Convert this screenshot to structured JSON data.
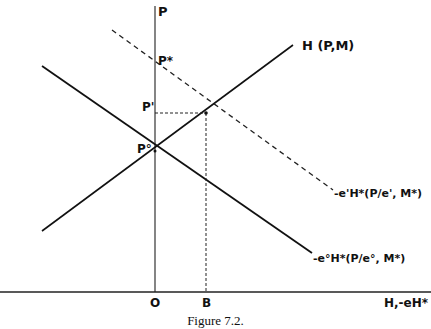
{
  "figure": {
    "caption": "Figure 7.2.",
    "axes": {
      "y_label": "P",
      "x_origin_label": "O",
      "x_label": "H,-eH*"
    },
    "points": {
      "p_star": "P*",
      "p_prime": "P'",
      "p_zero": "P°",
      "b": "B"
    },
    "curves": {
      "h_curve": "H (P,M)",
      "dashed_curve": "-e'H*(P/e', M*)",
      "solid_down_curve": "-e°H*(P/e°, M*)"
    },
    "colors": {
      "ink": "#111111",
      "background": "#ffffff"
    }
  }
}
